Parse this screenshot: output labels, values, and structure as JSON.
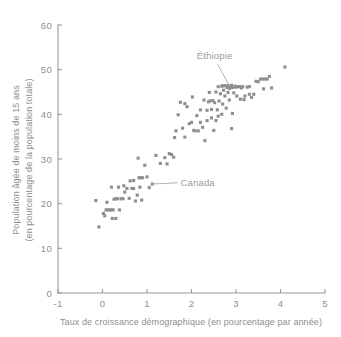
{
  "chart_data": {
    "type": "scatter",
    "title": "",
    "xlabel": "Taux de croissance démographique (en pourcentage par année)",
    "ylabel_line1": "Population âgée de moins de 15 ans",
    "ylabel_line2": "(en pourcentage de la population totale)",
    "xlim": [
      -1,
      5
    ],
    "ylim": [
      0,
      60
    ],
    "xticks": [
      -1,
      0,
      1,
      2,
      3,
      4,
      5
    ],
    "xtick_labels": [
      "-1",
      "0",
      "1",
      "2",
      "3",
      "4",
      "5"
    ],
    "yticks": [
      0,
      10,
      20,
      30,
      40,
      50,
      60
    ],
    "ytick_labels": [
      "0",
      "10",
      "20",
      "30",
      "40",
      "50",
      "60"
    ],
    "grid": false,
    "legend": "none",
    "marker": "square",
    "marker_color": "#8e8e8e",
    "marker_size": 3.1,
    "points": [
      [
        -0.15,
        20.7
      ],
      [
        -0.08,
        14.8
      ],
      [
        0.02,
        17.8
      ],
      [
        0.05,
        17.3
      ],
      [
        0.08,
        18.6
      ],
      [
        0.12,
        18.6
      ],
      [
        0.16,
        18.6
      ],
      [
        0.2,
        18.6
      ],
      [
        0.24,
        18.6
      ],
      [
        0.1,
        20.3
      ],
      [
        0.2,
        23.7
      ],
      [
        0.22,
        16.7
      ],
      [
        0.3,
        21.1
      ],
      [
        0.34,
        21.1
      ],
      [
        0.3,
        16.7
      ],
      [
        0.38,
        18.6
      ],
      [
        0.42,
        21.1
      ],
      [
        0.46,
        21.1
      ],
      [
        0.5,
        22.6
      ],
      [
        0.55,
        23.4
      ],
      [
        0.6,
        21.2
      ],
      [
        0.62,
        25.1
      ],
      [
        0.66,
        23.4
      ],
      [
        0.7,
        23.4
      ],
      [
        0.74,
        20.6
      ],
      [
        0.78,
        21.9
      ],
      [
        0.8,
        30.2
      ],
      [
        0.82,
        25.8
      ],
      [
        0.86,
        25.8
      ],
      [
        0.9,
        25.8
      ],
      [
        0.84,
        23.7
      ],
      [
        0.88,
        20.8
      ],
      [
        0.95,
        28.6
      ],
      [
        1.0,
        26.0
      ],
      [
        1.05,
        23.6
      ],
      [
        1.12,
        24.4
      ],
      [
        1.2,
        30.8
      ],
      [
        1.3,
        29.0
      ],
      [
        1.4,
        30.3
      ],
      [
        1.45,
        28.9
      ],
      [
        1.55,
        31.0
      ],
      [
        1.6,
        30.4
      ],
      [
        1.62,
        34.8
      ],
      [
        1.65,
        36.3
      ],
      [
        1.7,
        39.9
      ],
      [
        1.75,
        42.7
      ],
      [
        1.8,
        36.9
      ],
      [
        1.85,
        34.9
      ],
      [
        1.9,
        41.7
      ],
      [
        1.95,
        37.9
      ],
      [
        2.0,
        38.2
      ],
      [
        2.02,
        43.9
      ],
      [
        2.05,
        36.4
      ],
      [
        2.08,
        36.3
      ],
      [
        2.12,
        39.7
      ],
      [
        2.15,
        36.3
      ],
      [
        2.2,
        38.2
      ],
      [
        2.25,
        37.1
      ],
      [
        2.3,
        34.1
      ],
      [
        2.35,
        38.6
      ],
      [
        2.38,
        42.8
      ],
      [
        2.4,
        44.9
      ],
      [
        2.42,
        43.0
      ],
      [
        2.45,
        41.1
      ],
      [
        2.48,
        43.1
      ],
      [
        2.5,
        36.4
      ],
      [
        2.52,
        42.6
      ],
      [
        2.55,
        45.0
      ],
      [
        2.58,
        41.0
      ],
      [
        2.6,
        39.6
      ],
      [
        2.62,
        43.0
      ],
      [
        2.65,
        44.6
      ],
      [
        2.68,
        46.3
      ],
      [
        2.7,
        42.3
      ],
      [
        2.72,
        45.4
      ],
      [
        2.75,
        44.1
      ],
      [
        2.78,
        41.4
      ],
      [
        2.8,
        46.0
      ],
      [
        2.82,
        44.9
      ],
      [
        2.85,
        43.2
      ],
      [
        2.88,
        46.2
      ],
      [
        2.9,
        36.8
      ],
      [
        2.92,
        40.2
      ],
      [
        2.95,
        44.8
      ],
      [
        2.98,
        46.3
      ],
      [
        3.0,
        46.1
      ],
      [
        3.02,
        44.1
      ],
      [
        3.05,
        46.2
      ],
      [
        3.08,
        46.2
      ],
      [
        3.1,
        43.4
      ],
      [
        3.12,
        45.9
      ],
      [
        3.15,
        46.2
      ],
      [
        3.18,
        43.3
      ],
      [
        3.2,
        44.1
      ],
      [
        3.25,
        46.1
      ],
      [
        3.3,
        44.5
      ],
      [
        3.35,
        43.8
      ],
      [
        3.4,
        44.5
      ],
      [
        3.45,
        47.4
      ],
      [
        3.5,
        47.3
      ],
      [
        3.55,
        47.9
      ],
      [
        3.6,
        47.9
      ],
      [
        3.62,
        45.7
      ],
      [
        3.65,
        47.9
      ],
      [
        3.7,
        47.9
      ],
      [
        3.75,
        48.5
      ],
      [
        3.8,
        45.9
      ],
      [
        4.1,
        50.6
      ],
      [
        2.9,
        46.5
      ],
      [
        2.93,
        46.0
      ],
      [
        2.86,
        45.8
      ],
      [
        2.7,
        46.4
      ],
      [
        2.76,
        46.4
      ],
      [
        2.82,
        46.4
      ],
      [
        1.85,
        42.4
      ],
      [
        2.28,
        43.2
      ],
      [
        2.6,
        46.2
      ],
      [
        2.2,
        41.0
      ],
      [
        0.7,
        25.2
      ],
      [
        0.48,
        24.0
      ],
      [
        0.36,
        23.7
      ],
      [
        0.26,
        21.0
      ],
      [
        1.5,
        31.2
      ],
      [
        2.45,
        39.2
      ],
      [
        2.35,
        40.9
      ],
      [
        2.55,
        38.6
      ],
      [
        2.68,
        40.0
      ],
      [
        3.3,
        46.2
      ]
    ],
    "annotations": [
      {
        "label": "Éthiopie",
        "label_x": 2.52,
        "label_y": 52.3,
        "target_x": 2.86,
        "target_y": 46.3
      },
      {
        "label": "Canada",
        "label_x": 1.75,
        "label_y": 24.0,
        "target_x": 1.12,
        "target_y": 24.4
      }
    ]
  }
}
